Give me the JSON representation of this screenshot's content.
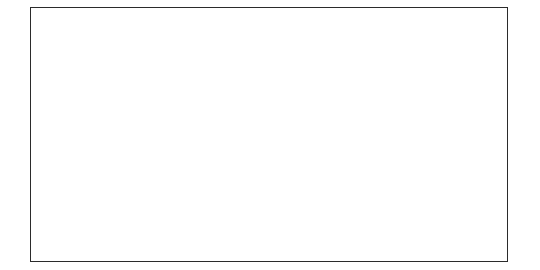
{
  "figure": {
    "border_color": "#2b2b2b",
    "background": "#ffffff"
  },
  "chart_data": {
    "type": "line",
    "title": "",
    "xlabel": "",
    "ylabel": "Mean crime days/year",
    "ylim": [
      0,
      250
    ],
    "ytick_values": [
      0,
      50,
      100,
      150,
      200,
      250
    ],
    "ytick_labels": [
      "0",
      "50",
      "100",
      "150",
      "200",
      "250"
    ],
    "grid": true,
    "legend": false,
    "legend_position": "none",
    "marker": "diamond",
    "line_color": "#8f8f8f",
    "marker_color": "#9a9a9a",
    "grid_color": "#8c8c8c",
    "xtick_rotation_deg": 45,
    "categories": [
      "23.5-mo pre-treatment",
      "4 mo treatment",
      "1 yr treatment",
      "2 yr treatment",
      "3 yr treatment",
      "4 yr treatment",
      "5 yr treatment",
      "6+yr treatment"
    ],
    "values": [
      237,
      70,
      28,
      22,
      14,
      31,
      31,
      14
    ]
  }
}
